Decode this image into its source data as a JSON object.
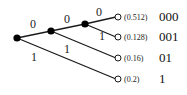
{
  "diagram": {
    "title": "",
    "type": "binary code tree",
    "edge_labels": {
      "root_upper": "0",
      "root_lower": "1",
      "n2_upper": "0",
      "n2_lower": "1",
      "n3_upper": "0",
      "n3_lower": "1"
    },
    "leaves": [
      {
        "probability": "(0.512)",
        "code": "000"
      },
      {
        "probability": "(0.128)",
        "code": "001"
      },
      {
        "probability": "(0.16)",
        "code": "01"
      },
      {
        "probability": "(0.2)",
        "code": "1"
      }
    ],
    "colors": {
      "line": "#1a1a1a",
      "inner_node": "#000000",
      "leaf_node_fill": "#ffffff"
    }
  }
}
